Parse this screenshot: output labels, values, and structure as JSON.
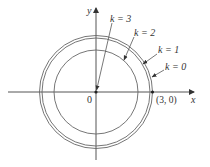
{
  "figure": {
    "axes": {
      "x_label": "x",
      "y_label": "y",
      "origin_label": "0"
    },
    "point_label": "(3, 0)",
    "curves": [
      {
        "k_label": "k = 3",
        "radius_px": 0
      },
      {
        "k_label": "k = 2",
        "radius_px": 42
      },
      {
        "k_label": "k = 1",
        "radius_px": 54
      },
      {
        "k_label": "k = 0",
        "radius_px": 56
      }
    ],
    "colors": {
      "line": "#555555",
      "text": "#333333",
      "background": "#ffffff"
    }
  }
}
